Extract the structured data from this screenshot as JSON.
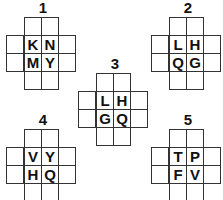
{
  "puzzles": [
    {
      "number": "1",
      "letters": [
        "K",
        "N",
        "M",
        "Y"
      ]
    },
    {
      "number": "2",
      "letters": [
        "L",
        "H",
        "Q",
        "G"
      ]
    },
    {
      "number": "3",
      "letters": [
        "L",
        "H",
        "G",
        "Q"
      ]
    },
    {
      "number": "4",
      "letters": [
        "V",
        "Y",
        "H",
        "Q"
      ]
    },
    {
      "number": "5",
      "letters": [
        "T",
        "P",
        "F",
        "V"
      ]
    }
  ],
  "colors": {
    "line": "#333333",
    "text": "#111111",
    "background": "#ffffff"
  }
}
